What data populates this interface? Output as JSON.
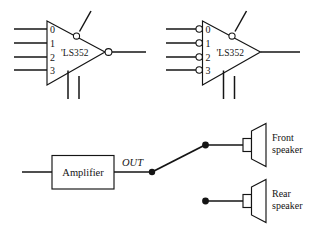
{
  "figure": {
    "background_color": "#ffffff",
    "line_color": "#141414",
    "mux_left": {
      "chip_name": "'LS352",
      "input_labels": [
        "0",
        "1",
        "2",
        "3"
      ],
      "has_input_bubbles": false,
      "has_output_bubble": true,
      "has_select_bubble": true,
      "bottom_control_lines": 2
    },
    "mux_right": {
      "chip_name": "'LS352",
      "input_labels": [
        "0",
        "1",
        "2",
        "3"
      ],
      "has_input_bubbles": true,
      "has_output_bubble": false,
      "has_select_bubble": true,
      "bottom_control_lines": 2
    },
    "audio": {
      "amplifier_label": "Amplifier",
      "output_label": "OUT",
      "speakers": [
        {
          "line1": "Front",
          "line2": "speaker",
          "connected": true
        },
        {
          "line1": "Rear",
          "line2": "speaker",
          "connected": false
        }
      ]
    }
  }
}
